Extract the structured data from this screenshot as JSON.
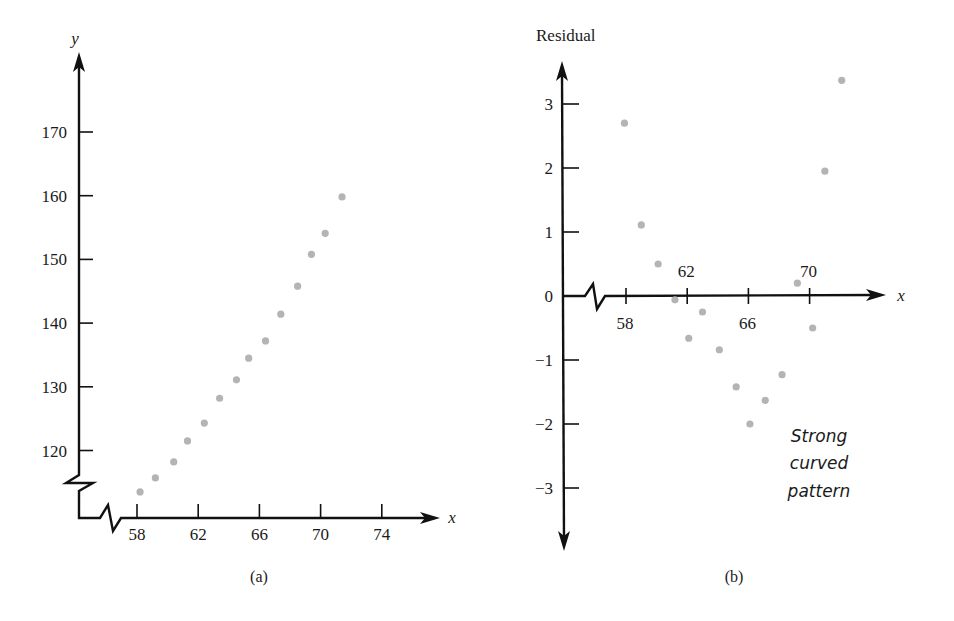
{
  "chart_data": [
    {
      "id": "a",
      "type": "scatter",
      "title": "",
      "caption": "(a)",
      "xlabel": "x",
      "ylabel": "y",
      "x_ticks": [
        58,
        62,
        66,
        70,
        74
      ],
      "y_ticks": [
        120,
        130,
        140,
        150,
        160,
        170
      ],
      "xlim": [
        55.5,
        76
      ],
      "ylim": [
        109,
        180
      ],
      "axis_breaks": [
        "x",
        "y"
      ],
      "grid": false,
      "legend": null,
      "series": [
        {
          "name": "data",
          "x": [
            58.2,
            59.2,
            60.4,
            61.3,
            62.4,
            63.4,
            64.5,
            65.3,
            66.4,
            67.4,
            68.5,
            69.4,
            70.3,
            71.4
          ],
          "y": [
            113.5,
            115.7,
            118.2,
            121.5,
            124.3,
            128.2,
            131.1,
            134.5,
            137.2,
            141.4,
            145.8,
            150.8,
            154.1,
            159.8
          ]
        }
      ]
    },
    {
      "id": "b",
      "type": "scatter",
      "title": "",
      "caption": "(b)",
      "xlabel": "x",
      "ylabel": "Residual",
      "x_ticks": [
        58,
        62,
        66,
        70
      ],
      "x_ticks_above": [
        62,
        70
      ],
      "x_ticks_below": [
        58,
        66
      ],
      "y_ticks": [
        -3,
        -2,
        -1,
        0,
        1,
        2,
        3
      ],
      "xlim": [
        55.5,
        74
      ],
      "ylim": [
        -3.9,
        3.7
      ],
      "axis_breaks": [
        "x"
      ],
      "grid": false,
      "legend": null,
      "annotation": [
        "Strong",
        "curved",
        "pattern"
      ],
      "series": [
        {
          "name": "residuals",
          "x": [
            57.9,
            59.0,
            60.1,
            61.2,
            62.1,
            63.0,
            64.1,
            65.2,
            66.1,
            67.1,
            68.2,
            69.2,
            70.2,
            71.0,
            72.1
          ],
          "y": [
            2.7,
            1.11,
            0.5,
            -0.06,
            -0.66,
            -0.25,
            -0.84,
            -1.42,
            -2.0,
            -1.63,
            -1.23,
            0.2,
            -0.5,
            1.95,
            3.37
          ]
        }
      ]
    }
  ],
  "colors": {
    "axis": "#111111",
    "dot": "#b4b4b4",
    "background": "#ffffff"
  }
}
